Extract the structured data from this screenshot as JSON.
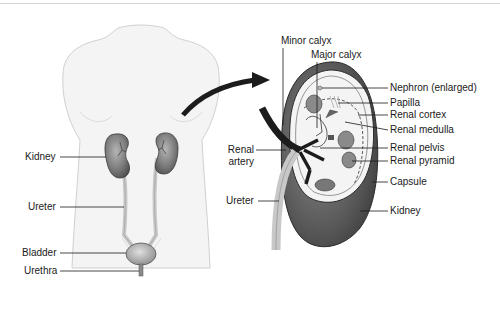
{
  "diagram": {
    "type": "anatomical-illustration",
    "colors": {
      "body_fill": "#f3f3f3",
      "body_outline": "#d2d2d2",
      "kidney_dark": "#5a5a5a",
      "kidney_light": "#9a9a9a",
      "arrow": "#1c1c1c",
      "label_text": "#1a1a1a"
    },
    "body_labels": [
      {
        "id": "kidney",
        "text": "Kidney"
      },
      {
        "id": "ureter",
        "text": "Ureter"
      },
      {
        "id": "bladder",
        "text": "Bladder"
      },
      {
        "id": "urethra",
        "text": "Urethra"
      }
    ],
    "kidney_top_labels": [
      {
        "id": "minor-calyx",
        "text": "Minor calyx"
      },
      {
        "id": "major-calyx",
        "text": "Major calyx"
      }
    ],
    "kidney_left_labels": [
      {
        "id": "renal-artery",
        "text_line1": "Renal",
        "text_line2": "artery"
      },
      {
        "id": "ureter",
        "text": "Ureter"
      }
    ],
    "kidney_right_labels": [
      {
        "id": "nephron",
        "text": "Nephron (enlarged)"
      },
      {
        "id": "papilla",
        "text": "Papilla"
      },
      {
        "id": "renal-cortex",
        "text": "Renal cortex"
      },
      {
        "id": "renal-medulla",
        "text": "Renal medulla"
      },
      {
        "id": "renal-pelvis",
        "text": "Renal pelvis"
      },
      {
        "id": "renal-pyramid",
        "text": "Renal pyramid"
      },
      {
        "id": "capsule",
        "text": "Capsule"
      },
      {
        "id": "kidney",
        "text": "Kidney"
      }
    ]
  }
}
